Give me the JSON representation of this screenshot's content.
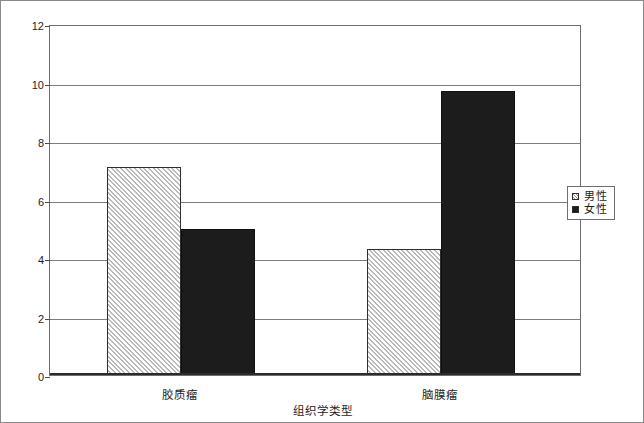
{
  "chart_data": {
    "type": "bar",
    "title": "",
    "xlabel": "组织学类型",
    "ylabel": "每 100 000 人口病例数",
    "categories": [
      "胶质瘤",
      "脑膜瘤"
    ],
    "series": [
      {
        "name": "男性",
        "values": [
          7.1,
          4.3
        ],
        "fill": "hatched"
      },
      {
        "name": "女性",
        "values": [
          5.0,
          9.7
        ],
        "fill": "solid"
      }
    ],
    "ylim": [
      0,
      12
    ],
    "yticks": [
      0,
      2,
      4,
      6,
      8,
      10,
      12
    ],
    "ytick_labels": [
      "0",
      "2",
      "4",
      "6",
      "8",
      "10",
      "12"
    ],
    "grid": true,
    "legend_position": "right",
    "colors": {
      "hatched_fill": "#e9e9e9",
      "hatched_line": "#b9b9b9",
      "solid_fill": "#1c1c1c",
      "bar_border": "#2e2e2e",
      "gridline": "#7d7d7d",
      "axis": "#2b2b2b",
      "frame": "#8a8a8a",
      "text": "#1d1d1d"
    }
  },
  "legend": {
    "items": [
      {
        "label": "男性",
        "swatch": "hatched-square-icon"
      },
      {
        "label": "女性",
        "swatch": "solid-square-icon"
      }
    ]
  }
}
